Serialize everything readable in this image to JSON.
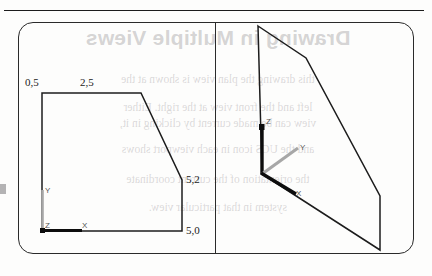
{
  "figure": {
    "top_rule": "horizontal-rule",
    "viewports": [
      {
        "name": "left-viewport",
        "kind": "orthographic-front-view"
      },
      {
        "name": "right-viewport",
        "kind": "isometric-3d-view"
      }
    ]
  },
  "left_view": {
    "labels": {
      "top_left": "0,5",
      "top_right": "2,5",
      "right_upper": "5,2",
      "right_lower": "5,0"
    },
    "axes": {
      "x": "X",
      "y": "Y",
      "z": "Z"
    },
    "profile_points": "42,93 141,93 182,180 182,231 42,231"
  },
  "right_view": {
    "axes": {
      "x": "X",
      "y": "Y",
      "z": "Z"
    },
    "profile_points": "258,26 306,58 380,196 380,250 262,174"
  },
  "bleed_through": {
    "title": "Drawing in Multiple Views",
    "lines": [
      "this drawing the plan view is shown at the",
      "left and the front view at the right. Either",
      "view can be made current by clicking in it,",
      "and the UCS icon in each viewport shows",
      "the orientation of the current coordinate",
      "system in that particular view."
    ]
  },
  "colors": {
    "ink": "#1c1c1c",
    "frame": "#2a2a2a",
    "label_text": "#222222",
    "axis_text": "#555555",
    "axis_dark": "#101010",
    "axis_gray": "#9a9a9a",
    "bleed": "#9c9a9c",
    "page_bg": "#fdfdfc"
  }
}
